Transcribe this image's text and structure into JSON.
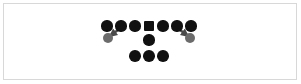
{
  "canvas": {
    "width": 301,
    "height": 84,
    "background": "#ffffff"
  },
  "border": {
    "color": "#6e6e6e",
    "outer_color": "#d8d8d8",
    "thickness": 1,
    "x": 3,
    "y": 3,
    "width": 294,
    "height": 77
  },
  "colors": {
    "primary_node": "#111111",
    "secondary_node": "#6b6b6b",
    "edge": "#4a4a4a"
  },
  "diagram": {
    "type": "node-link-graph",
    "node_count": 13,
    "edge_count": 2,
    "nodes": [
      {
        "id": "t1",
        "shape": "circle",
        "x": 107,
        "y": 26,
        "r": 5.6,
        "color": "#111111",
        "row": "top",
        "index": 1
      },
      {
        "id": "t2",
        "shape": "circle",
        "x": 121,
        "y": 26,
        "r": 5.6,
        "color": "#111111",
        "row": "top",
        "index": 2
      },
      {
        "id": "t3",
        "shape": "circle",
        "x": 135,
        "y": 26,
        "r": 5.6,
        "color": "#111111",
        "row": "top",
        "index": 3
      },
      {
        "id": "t4",
        "shape": "square",
        "x": 149,
        "y": 26,
        "r": 5.2,
        "color": "#111111",
        "row": "top",
        "index": 4
      },
      {
        "id": "t5",
        "shape": "circle",
        "x": 163,
        "y": 26,
        "r": 5.6,
        "color": "#111111",
        "row": "top",
        "index": 5
      },
      {
        "id": "t6",
        "shape": "circle",
        "x": 177,
        "y": 26,
        "r": 5.6,
        "color": "#111111",
        "row": "top",
        "index": 6
      },
      {
        "id": "t7",
        "shape": "circle",
        "x": 191,
        "y": 26,
        "r": 5.6,
        "color": "#111111",
        "row": "top",
        "index": 7
      },
      {
        "id": "gl",
        "shape": "circle",
        "x": 108,
        "y": 38,
        "r": 5.2,
        "color": "#6b6b6b",
        "row": "branch-left",
        "index": 1
      },
      {
        "id": "gr",
        "shape": "circle",
        "x": 190,
        "y": 38,
        "r": 5.2,
        "color": "#6b6b6b",
        "row": "branch-right",
        "index": 1
      },
      {
        "id": "m1",
        "shape": "circle",
        "x": 149,
        "y": 40,
        "r": 5.6,
        "color": "#111111",
        "row": "middle",
        "index": 1
      },
      {
        "id": "b1",
        "shape": "circle",
        "x": 135,
        "y": 56,
        "r": 5.8,
        "color": "#111111",
        "row": "bottom",
        "index": 1
      },
      {
        "id": "b2",
        "shape": "circle",
        "x": 149,
        "y": 56,
        "r": 5.8,
        "color": "#111111",
        "row": "bottom",
        "index": 2
      },
      {
        "id": "b3",
        "shape": "circle",
        "x": 163,
        "y": 56,
        "r": 5.8,
        "color": "#111111",
        "row": "bottom",
        "index": 3
      }
    ],
    "edges": [
      {
        "id": "e1",
        "from": "t2",
        "to": "gl",
        "x1": 118,
        "y1": 30,
        "x2": 110,
        "y2": 36,
        "arrow": true,
        "width": 2.4
      },
      {
        "id": "e2",
        "from": "t6",
        "to": "gr",
        "x1": 180,
        "y1": 30,
        "x2": 188,
        "y2": 36,
        "arrow": true,
        "width": 2.4
      }
    ]
  }
}
